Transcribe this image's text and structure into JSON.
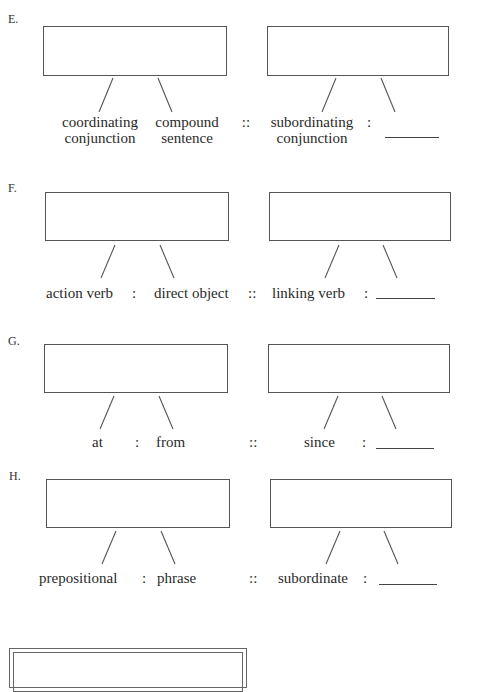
{
  "sections": [
    {
      "label": "E.",
      "left_pair": {
        "term1": "coordinating conjunction",
        "term1_line1": "coordinating",
        "term1_line2": "conjunction",
        "term2": "compound sentence",
        "term2_line1": "compound",
        "term2_line2": "sentence"
      },
      "right_pair": {
        "term1": "subordinating conjunction",
        "term1_line1": "subordinating",
        "term1_line2": "conjunction",
        "term2": "_______"
      },
      "separator": ":",
      "analogy_separator": "::"
    },
    {
      "label": "F.",
      "left_pair": {
        "term1": "action verb",
        "term2": "direct object"
      },
      "right_pair": {
        "term1": "linking verb",
        "term2": "_______"
      },
      "separator": ":",
      "analogy_separator": "::"
    },
    {
      "label": "G.",
      "left_pair": {
        "term1": "at",
        "term2": "from"
      },
      "right_pair": {
        "term1": "since",
        "term2": "_______"
      },
      "separator": ":",
      "analogy_separator": "::"
    },
    {
      "label": "H.",
      "left_pair": {
        "term1": "prepositional",
        "term2": "phrase"
      },
      "right_pair": {
        "term1": "subordinate",
        "term2": "_______"
      },
      "separator": ":",
      "analogy_separator": "::"
    }
  ],
  "footer_box": {
    "text": ""
  }
}
